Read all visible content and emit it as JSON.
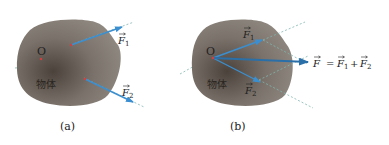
{
  "panels": [
    {
      "id": "a",
      "caption": "(a)",
      "point_label": "O",
      "object_label": "物体",
      "forces": [
        {
          "symbol": "F",
          "subscript": "1"
        },
        {
          "symbol": "F",
          "subscript": "2"
        }
      ]
    },
    {
      "id": "b",
      "caption": "(b)",
      "point_label": "O",
      "object_label": "物体",
      "forces": [
        {
          "symbol": "F",
          "subscript": "1"
        },
        {
          "symbol": "F",
          "subscript": "2"
        }
      ],
      "resultant": {
        "lhs": "F",
        "equals": "=",
        "term1": "F",
        "term1_sub": "1",
        "plus": "+",
        "term2": "F",
        "term2_sub": "2"
      }
    }
  ],
  "colors": {
    "arrow": "#3b8fd0",
    "resultant": "#2a6fa8",
    "dashed_line": "#7fb6b0",
    "object_dark": "#4f4740",
    "object_light": "#8d857d",
    "point_mark": "#d04040"
  }
}
